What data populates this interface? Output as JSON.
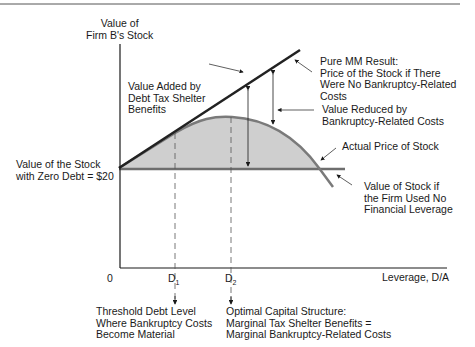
{
  "diagram": {
    "title_rule": true,
    "y_axis_label": "Value of\nFirm B's Stock",
    "x_axis_label": "Leverage, D/A",
    "origin_label": "0",
    "zero_debt_label": "Value of the Stock\nwith Zero Debt = $20",
    "d1_label": "D",
    "d1_sub": "1",
    "d2_label": "D",
    "d2_sub": "2",
    "annotations": {
      "pure_mm": "Pure MM Result:\nPrice of the Stock if There\nWere No Bankruptcy-Related\nCosts",
      "value_added": "Value Added by\nDebt Tax Shelter\nBenefits",
      "value_reduced": "Value Reduced by\nBankruptcy-Related Costs",
      "actual_price": "Actual Price of Stock",
      "no_leverage": "Value of Stock if\nthe Firm Used No\nFinancial Leverage",
      "threshold": "Threshold Debt Level\nWhere Bankruptcy Costs\nBecome Material",
      "optimal": "Optimal Capital Structure:\nMarginal Tax Shelter Benefits =\nMarginal Bankruptcy-Related Costs"
    },
    "colors": {
      "mm_line": "#222222",
      "actual_curve": "#7a7a7a",
      "shade": "#cfcfcf",
      "zero_debt_line": "#6e6e6e",
      "axis": "#1a1a1a"
    }
  }
}
